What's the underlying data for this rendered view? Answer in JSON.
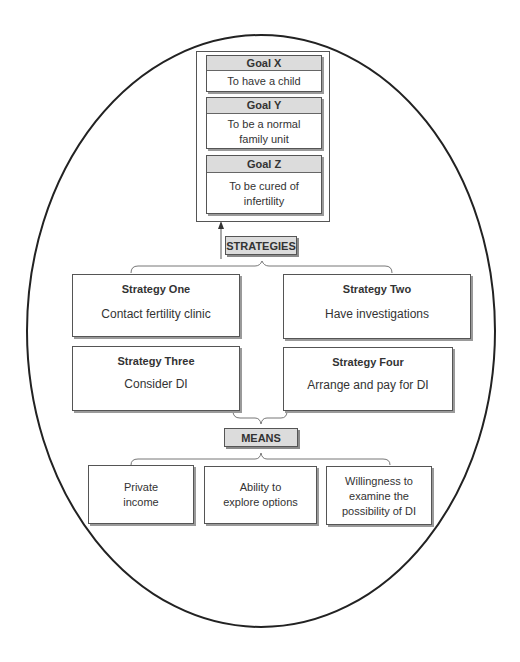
{
  "goals": [
    {
      "title": "Goal X",
      "text": "To have a child"
    },
    {
      "title": "Goal Y",
      "text": "To be a normal\nfamily unit"
    },
    {
      "title": "Goal Z",
      "text": "To be cured of\ninfertility"
    }
  ],
  "strategies_label": "STRATEGIES",
  "strategies": [
    {
      "title": "Strategy One",
      "text": "Contact fertility clinic"
    },
    {
      "title": "Strategy Two",
      "text": "Have investigations"
    },
    {
      "title": "Strategy Three",
      "text": "Consider DI"
    },
    {
      "title": "Strategy Four",
      "text": "Arrange and pay for DI"
    }
  ],
  "means_label": "MEANS",
  "means": [
    {
      "text": "Private\nincome"
    },
    {
      "text": "Ability to\nexplore options"
    },
    {
      "text": "Willingness to\nexamine the\npossibility of DI"
    }
  ],
  "colors": {
    "outline": "#222222",
    "box_border": "#555555",
    "header_fill": "#dcdcdc",
    "shadow": "#9a9a9a",
    "text": "#333333"
  }
}
